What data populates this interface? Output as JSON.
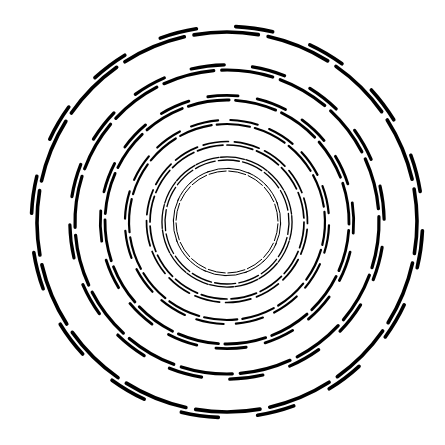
{
  "figure": {
    "title": "Concentric circles spiral illusion",
    "background": "#ffffff",
    "stroke_color": "#000000",
    "center": [
      227,
      222
    ],
    "segments_per_ring": 16,
    "segment_gap_deg": 3,
    "dash_length_deg": 9,
    "dash_radial_offset": 4,
    "start_angle_deg": -100,
    "rings": [
      {
        "radius": 190,
        "stroke_width": 3.6,
        "phase_deg": 0
      },
      {
        "radius": 152,
        "stroke_width": 3.2,
        "phase_deg": 8
      },
      {
        "radius": 122,
        "stroke_width": 2.8,
        "phase_deg": 14
      },
      {
        "radius": 98,
        "stroke_width": 2.2,
        "phase_deg": 4
      },
      {
        "radius": 77,
        "stroke_width": 1.7,
        "phase_deg": 10
      },
      {
        "radius": 62,
        "stroke_width": 1.3,
        "phase_deg": 2
      },
      {
        "radius": 51,
        "stroke_width": 1.0,
        "phase_deg": 12
      }
    ]
  }
}
